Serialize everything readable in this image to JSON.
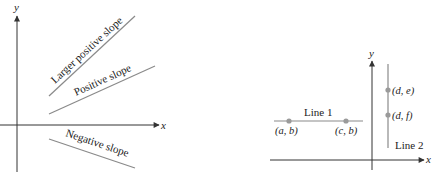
{
  "colors": {
    "axis": "#333333",
    "line": "#8a8a8a",
    "point": "#9a9a9a",
    "text": "#222222"
  },
  "left_diagram": {
    "x_axis_label": "x",
    "y_axis_label": "y",
    "lines": [
      {
        "label": "Larger positive slope"
      },
      {
        "label": "Positive slope"
      },
      {
        "label": "Negative slope"
      }
    ]
  },
  "right_diagram": {
    "x_axis_label": "x",
    "y_axis_label": "y",
    "line1": {
      "label": "Line 1",
      "points": [
        {
          "label": "(a, b)"
        },
        {
          "label": "(c, b)"
        }
      ]
    },
    "line2": {
      "label": "Line 2",
      "points": [
        {
          "label": "(d, e)"
        },
        {
          "label": "(d, f)"
        }
      ]
    }
  }
}
